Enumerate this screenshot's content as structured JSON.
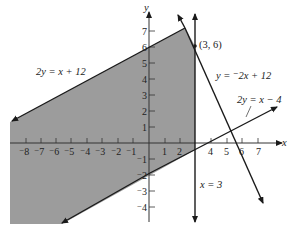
{
  "figure": {
    "axes": {
      "x_label": "x",
      "y_label": "y",
      "x_ticks": [
        {
          "label": "⁻8",
          "value": -8
        },
        {
          "label": "⁻7",
          "value": -7
        },
        {
          "label": "⁻6",
          "value": -6
        },
        {
          "label": "⁻5",
          "value": -5
        },
        {
          "label": "⁻4",
          "value": -4
        },
        {
          "label": "⁻3",
          "value": -3
        },
        {
          "label": "⁻2",
          "value": -2
        },
        {
          "label": "⁻1",
          "value": -1
        },
        {
          "label": "1",
          "value": 1
        },
        {
          "label": "2",
          "value": 2
        },
        {
          "label": "4",
          "value": 4
        },
        {
          "label": "5",
          "value": 5
        },
        {
          "label": "6",
          "value": 6
        },
        {
          "label": "7",
          "value": 7
        }
      ],
      "y_ticks": [
        {
          "label": "7",
          "value": 7
        },
        {
          "label": "6",
          "value": 6
        },
        {
          "label": "5",
          "value": 5
        },
        {
          "label": "4",
          "value": 4
        },
        {
          "label": "3",
          "value": 3
        },
        {
          "label": "2",
          "value": 2
        },
        {
          "label": "1",
          "value": 1
        },
        {
          "label": "⁻1",
          "value": -1
        },
        {
          "label": "⁻2",
          "value": -2
        },
        {
          "label": "⁻3",
          "value": -3
        },
        {
          "label": "⁻4",
          "value": -4
        }
      ]
    },
    "lines": [
      {
        "id": "line1",
        "label": "2y = x + 12"
      },
      {
        "id": "line2",
        "label": "y = ⁻2x + 12"
      },
      {
        "id": "line3",
        "label": "2y = x − 4"
      },
      {
        "id": "line4",
        "label": "x = 3"
      }
    ],
    "points": [
      {
        "label": "(3, 6)",
        "x": 3,
        "y": 6
      }
    ],
    "region": {
      "fill": "#9a9a9a",
      "description": "shaded feasible region"
    }
  }
}
